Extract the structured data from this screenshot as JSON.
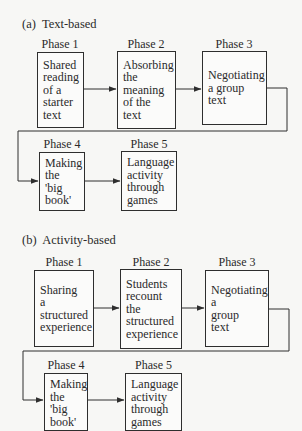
{
  "diagram": {
    "sections": [
      {
        "label": "(a)  Text-based",
        "phases": [
          {
            "label": "Phase 1",
            "lines": [
              "Shared",
              "reading",
              "of a",
              "starter",
              "text"
            ]
          },
          {
            "label": "Phase 2",
            "lines": [
              "Absorbing",
              "the",
              "meaning",
              "of the",
              "text"
            ]
          },
          {
            "label": "Phase 3",
            "lines": [
              "Negotiating",
              "a group",
              "text"
            ]
          },
          {
            "label": "Phase 4",
            "lines": [
              "Making",
              "the",
              "'big",
              "book'"
            ]
          },
          {
            "label": "Phase 5",
            "lines": [
              "Language",
              "activity",
              "through",
              "games"
            ]
          }
        ]
      },
      {
        "label": "(b)  Activity-based",
        "phases": [
          {
            "label": "Phase 1",
            "lines": [
              "Sharing",
              "a",
              "structured",
              "experience"
            ]
          },
          {
            "label": "Phase 2",
            "lines": [
              "Students",
              "recount",
              "the",
              "structured",
              "experience"
            ]
          },
          {
            "label": "Phase 3",
            "lines": [
              "Negotiating",
              "a",
              "group",
              "text"
            ]
          },
          {
            "label": "Phase 4",
            "lines": [
              "Making",
              "the",
              "'big",
              "book'"
            ]
          },
          {
            "label": "Phase 5",
            "lines": [
              "Language",
              "activity",
              "through",
              "games"
            ]
          }
        ]
      }
    ],
    "colors": {
      "line": "#2e2e2e",
      "background": "#f7f7f5"
    }
  }
}
